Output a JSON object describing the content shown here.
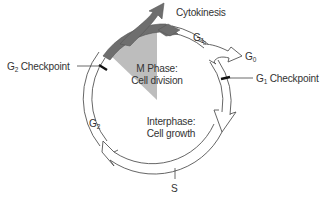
{
  "diagram": {
    "colors": {
      "m_phase_band": "#6e6e6e",
      "m_phase_wedge": "#bdbdbd",
      "ring_stroke": "#555555",
      "checkpoint_mark": "#111111",
      "text": "#333333",
      "background": "#ffffff"
    },
    "labels": {
      "cytokinesis": "Cytokinesis",
      "g1": {
        "base": "G",
        "sub": "1"
      },
      "g0": {
        "base": "G",
        "sub": "0"
      },
      "g1_checkpoint": {
        "base": "G",
        "sub": "1",
        "rest": " Checkpoint"
      },
      "g2_checkpoint": {
        "base": "G",
        "sub": "2",
        "rest": " Checkpoint"
      },
      "g2": {
        "base": "G",
        "sub": "2"
      },
      "s": "S",
      "m_phase": {
        "line1": "M Phase:",
        "line2": "Cell division"
      },
      "interphase": {
        "line1": "Interphase:",
        "line2": "Cell growth"
      }
    },
    "nodes": [
      {
        "id": "m_phase",
        "label": "M Phase: Cell division",
        "shape": "shaded wedge + dark arc band"
      },
      {
        "id": "interphase",
        "label": "Interphase: Cell growth",
        "shape": "circle interior"
      },
      {
        "id": "g1",
        "label": "G1",
        "position": "top-right arc"
      },
      {
        "id": "g0",
        "label": "G0",
        "position": "exit arrow right"
      },
      {
        "id": "s",
        "label": "S",
        "position": "bottom"
      },
      {
        "id": "g2",
        "label": "G2",
        "position": "left arc"
      },
      {
        "id": "cytokinesis",
        "label": "Cytokinesis",
        "position": "top exit arrow"
      }
    ],
    "edges": [
      {
        "from": "m_phase",
        "to": "cytokinesis"
      },
      {
        "from": "m_phase",
        "to": "g1"
      },
      {
        "from": "g1",
        "to": "g0"
      },
      {
        "from": "g1",
        "to": "s",
        "via": "G1 Checkpoint"
      },
      {
        "from": "s",
        "to": "g2"
      },
      {
        "from": "g2",
        "to": "m_phase",
        "via": "G2 Checkpoint"
      }
    ]
  }
}
